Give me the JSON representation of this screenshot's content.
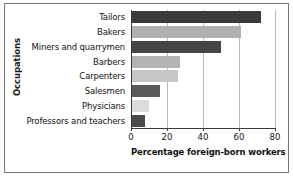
{
  "chart_data": {
    "type": "bar",
    "orientation": "horizontal",
    "title": "",
    "xlabel": "Percentage foreign-born workers",
    "ylabel": "Occupations",
    "categories": [
      "Tailors",
      "Bakers",
      "Miners and quarrymen",
      "Barbers",
      "Carpenters",
      "Salesmen",
      "Physicians",
      "Professors and teachers"
    ],
    "values": [
      72,
      61,
      50,
      27,
      26,
      16,
      10,
      8
    ],
    "bar_colors": [
      "#3b3b3b",
      "#b0b0b0",
      "#454545",
      "#b4b4b4",
      "#c6c6c6",
      "#5a5a5a",
      "#dcdcdc",
      "#4a4a4a"
    ],
    "xlim": [
      0,
      80
    ],
    "xticks": [
      0,
      20,
      40,
      60,
      80
    ],
    "xtick_labels": [
      "0",
      "20",
      "40",
      "60",
      "80"
    ],
    "grid": true,
    "grid_axis": "x",
    "legend": "none"
  },
  "figure": {
    "frame_color": "#767676",
    "axis_color": "#3a3a3a",
    "gridline_color": "#b8b8b8",
    "background": "#ffffff"
  }
}
